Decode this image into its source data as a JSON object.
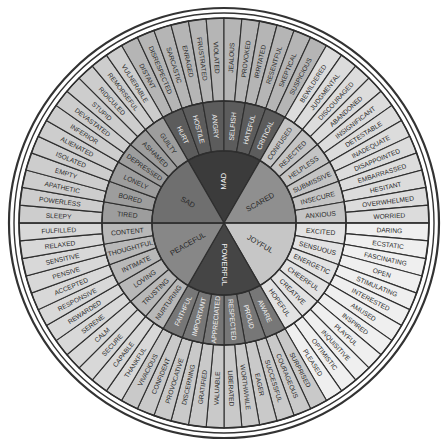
{
  "geometry": {
    "cx": 224,
    "cy": 223,
    "r_core": 72,
    "r_mid": 122,
    "r_outer": 205,
    "r_border1": 210,
    "r_border2": 215
  },
  "colors": {
    "background": "#ffffff",
    "border": "#333333",
    "line": "#2e2e2e",
    "mad_core": "#3b3b3b",
    "mad_mid": "#5c5c5c",
    "mad_outer": "#b5b5b5",
    "scared_core": "#8f8f8f",
    "scared_mid": "#c4c4c4",
    "scared_outer": "#dcdcdc",
    "joyful_core": "#c6c6c6",
    "joyful_mid": "#e2e2e2",
    "joyful_outer": "#efefef",
    "powerful_core": "#454545",
    "powerful_mid": "#777777",
    "powerful_outer": "#c9c9c9",
    "peaceful_core": "#878787",
    "peaceful_mid": "#b8b8b8",
    "peaceful_outer": "#d8d8d8",
    "sad_core": "#6f6f6f",
    "sad_mid": "#9d9d9d",
    "sad_outer": "#cdcdcd",
    "light_text": "#f2f2f2",
    "dark_text": "#2a2a2a"
  },
  "core": [
    {
      "label": "Mad",
      "start": -30,
      "end": 30,
      "group": "mad",
      "text": "light"
    },
    {
      "label": "Scared",
      "start": 30,
      "end": 90,
      "group": "scared",
      "text": "dark"
    },
    {
      "label": "Joyful",
      "start": 90,
      "end": 150,
      "group": "joyful",
      "text": "dark"
    },
    {
      "label": "Powerful",
      "start": 150,
      "end": 210,
      "group": "powerful",
      "text": "light"
    },
    {
      "label": "Peaceful",
      "start": 210,
      "end": 270,
      "group": "peaceful",
      "text": "dark"
    },
    {
      "label": "Sad",
      "start": 270,
      "end": 330,
      "group": "sad",
      "text": "dark"
    }
  ],
  "middle": [
    {
      "label": "Hurt",
      "group": "mad",
      "text": "light"
    },
    {
      "label": "Hostile",
      "group": "mad",
      "text": "light"
    },
    {
      "label": "Angry",
      "group": "mad",
      "text": "light"
    },
    {
      "label": "Selfish",
      "group": "mad",
      "text": "light"
    },
    {
      "label": "Hateful",
      "group": "mad",
      "text": "light"
    },
    {
      "label": "Critical",
      "group": "mad",
      "text": "light"
    },
    {
      "label": "Confused",
      "group": "scared",
      "text": "dark"
    },
    {
      "label": "Rejected",
      "group": "scared",
      "text": "dark"
    },
    {
      "label": "Helpless",
      "group": "scared",
      "text": "dark"
    },
    {
      "label": "Submissive",
      "group": "scared",
      "text": "dark"
    },
    {
      "label": "Insecure",
      "group": "scared",
      "text": "dark"
    },
    {
      "label": "Anxious",
      "group": "scared",
      "text": "dark"
    },
    {
      "label": "Excited",
      "group": "joyful",
      "text": "dark"
    },
    {
      "label": "Sensuous",
      "group": "joyful",
      "text": "dark"
    },
    {
      "label": "Energetic",
      "group": "joyful",
      "text": "dark"
    },
    {
      "label": "Cheerful",
      "group": "joyful",
      "text": "dark"
    },
    {
      "label": "Creative",
      "group": "joyful",
      "text": "dark"
    },
    {
      "label": "Hopeful",
      "group": "joyful",
      "text": "dark"
    },
    {
      "label": "Aware",
      "group": "powerful",
      "text": "light"
    },
    {
      "label": "Proud",
      "group": "powerful",
      "text": "light"
    },
    {
      "label": "Respected",
      "group": "powerful",
      "text": "light"
    },
    {
      "label": "Appreciated",
      "group": "powerful",
      "text": "light"
    },
    {
      "label": "Important",
      "group": "powerful",
      "text": "light"
    },
    {
      "label": "Faithful",
      "group": "powerful",
      "text": "light"
    },
    {
      "label": "Nurturing",
      "group": "peaceful",
      "text": "dark"
    },
    {
      "label": "Trusting",
      "group": "peaceful",
      "text": "dark"
    },
    {
      "label": "Loving",
      "group": "peaceful",
      "text": "dark"
    },
    {
      "label": "Intimate",
      "group": "peaceful",
      "text": "dark"
    },
    {
      "label": "Thoughtful",
      "group": "peaceful",
      "text": "dark"
    },
    {
      "label": "Content",
      "group": "peaceful",
      "text": "dark"
    },
    {
      "label": "Tired",
      "group": "sad",
      "text": "dark"
    },
    {
      "label": "Bored",
      "group": "sad",
      "text": "dark"
    },
    {
      "label": "Lonely",
      "group": "sad",
      "text": "dark"
    },
    {
      "label": "Depressed",
      "group": "sad",
      "text": "dark"
    },
    {
      "label": "Ashamed",
      "group": "sad",
      "text": "dark"
    },
    {
      "label": "Guilty",
      "group": "sad",
      "text": "dark"
    }
  ],
  "outer": [
    {
      "label": "Distant",
      "group": "mad"
    },
    {
      "label": "Disrespected",
      "group": "mad"
    },
    {
      "label": "Sarcastic",
      "group": "mad"
    },
    {
      "label": "Enraged",
      "group": "mad"
    },
    {
      "label": "Frustrated",
      "group": "mad"
    },
    {
      "label": "Violated",
      "group": "mad"
    },
    {
      "label": "Jealous",
      "group": "mad"
    },
    {
      "label": "Provoked",
      "group": "mad"
    },
    {
      "label": "Irritated",
      "group": "mad"
    },
    {
      "label": "Resentful",
      "group": "mad"
    },
    {
      "label": "Skeptical",
      "group": "mad"
    },
    {
      "label": "Suspicious",
      "group": "mad"
    },
    {
      "label": "Bewildered",
      "group": "scared"
    },
    {
      "label": "Judgmental",
      "group": "scared"
    },
    {
      "label": "Discouraged",
      "group": "scared"
    },
    {
      "label": "Abandoned",
      "group": "scared"
    },
    {
      "label": "Insignificant",
      "group": "scared"
    },
    {
      "label": "Detestable",
      "group": "scared"
    },
    {
      "label": "Inadequate",
      "group": "scared"
    },
    {
      "label": "Disappointed",
      "group": "scared"
    },
    {
      "label": "Embarrassed",
      "group": "scared"
    },
    {
      "label": "Hesitant",
      "group": "scared"
    },
    {
      "label": "Overwhelmed",
      "group": "scared"
    },
    {
      "label": "Worried",
      "group": "scared"
    },
    {
      "label": "Daring",
      "group": "joyful"
    },
    {
      "label": "Ecstatic",
      "group": "joyful"
    },
    {
      "label": "Fascinating",
      "group": "joyful"
    },
    {
      "label": "Open",
      "group": "joyful"
    },
    {
      "label": "Stimulating",
      "group": "joyful"
    },
    {
      "label": "Interested",
      "group": "joyful"
    },
    {
      "label": "Amused",
      "group": "joyful"
    },
    {
      "label": "Inspired",
      "group": "joyful"
    },
    {
      "label": "Playful",
      "group": "joyful"
    },
    {
      "label": "Inquisitive",
      "group": "joyful"
    },
    {
      "label": "Optimistic",
      "group": "joyful"
    },
    {
      "label": "Pleased",
      "group": "joyful"
    },
    {
      "label": "Surprised",
      "group": "powerful"
    },
    {
      "label": "Courageous",
      "group": "powerful"
    },
    {
      "label": "Successful",
      "group": "powerful"
    },
    {
      "label": "Eager",
      "group": "powerful"
    },
    {
      "label": "Worthwhile",
      "group": "powerful"
    },
    {
      "label": "Liberated",
      "group": "powerful"
    },
    {
      "label": "Valuable",
      "group": "powerful"
    },
    {
      "label": "Gratified",
      "group": "powerful"
    },
    {
      "label": "Discerning",
      "group": "powerful"
    },
    {
      "label": "Provocative",
      "group": "powerful"
    },
    {
      "label": "Confident",
      "group": "powerful"
    },
    {
      "label": "Vivacious",
      "group": "powerful"
    },
    {
      "label": "Thankful",
      "group": "peaceful"
    },
    {
      "label": "Capable",
      "group": "peaceful"
    },
    {
      "label": "Secure",
      "group": "peaceful"
    },
    {
      "label": "Calm",
      "group": "peaceful"
    },
    {
      "label": "Serene",
      "group": "peaceful"
    },
    {
      "label": "Rewarded",
      "group": "peaceful"
    },
    {
      "label": "Responsive",
      "group": "peaceful"
    },
    {
      "label": "Accepted",
      "group": "peaceful"
    },
    {
      "label": "Pensive",
      "group": "peaceful"
    },
    {
      "label": "Sensitive",
      "group": "peaceful"
    },
    {
      "label": "Relaxed",
      "group": "peaceful"
    },
    {
      "label": "Fulfilled",
      "group": "peaceful"
    },
    {
      "label": "Sleepy",
      "group": "sad"
    },
    {
      "label": "Powerless",
      "group": "sad"
    },
    {
      "label": "Apathetic",
      "group": "sad"
    },
    {
      "label": "Empty",
      "group": "sad"
    },
    {
      "label": "Isolated",
      "group": "sad"
    },
    {
      "label": "Alienated",
      "group": "sad"
    },
    {
      "label": "Inferior",
      "group": "sad"
    },
    {
      "label": "Devastated",
      "group": "sad"
    },
    {
      "label": "Stupid",
      "group": "sad"
    },
    {
      "label": "Ridiculed",
      "group": "sad"
    },
    {
      "label": "Remorseful",
      "group": "sad"
    },
    {
      "label": "Vulnerable",
      "group": "sad"
    }
  ]
}
